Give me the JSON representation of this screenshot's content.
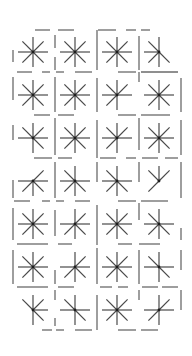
{
  "diagram": {
    "type": "star-grid-puzzle",
    "rows": 7,
    "cols": 4,
    "origin": {
      "x": 33,
      "y": 52
    },
    "spacing": {
      "x": 42,
      "y": 43
    },
    "spoke_length": 15,
    "colors": {
      "spoke": "#4a4a4a",
      "hub": "#1e1e1e",
      "wall": "#6a6a6a",
      "background": "#ffffff"
    },
    "cells": [
      [
        [
          "N",
          "NE",
          "E",
          "SE",
          "S",
          "SW",
          "W",
          "NW"
        ],
        [
          "N",
          "NE",
          "E",
          "SE",
          "S",
          "SW",
          "W",
          "NW"
        ],
        [
          "N",
          "NE",
          "E",
          "SE",
          "S",
          "SW",
          "W",
          "NW"
        ],
        [
          "N",
          "NW",
          "W",
          "SW",
          "S",
          "SE"
        ]
      ],
      [
        [
          "N",
          "NE",
          "E",
          "SE",
          "S",
          "SW",
          "W",
          "NW"
        ],
        [
          "N",
          "NE",
          "E",
          "SE",
          "S",
          "SW",
          "W",
          "NW"
        ],
        [
          "N",
          "NE",
          "E",
          "S",
          "SW",
          "W",
          "NW"
        ],
        [
          "N",
          "NE",
          "E",
          "SE",
          "S",
          "SW",
          "W",
          "NW"
        ]
      ],
      [
        [
          "N",
          "NE",
          "E",
          "SE",
          "S",
          "W",
          "NW"
        ],
        [
          "N",
          "NE",
          "E",
          "SE",
          "S",
          "SW",
          "W",
          "NW"
        ],
        [
          "N",
          "NE",
          "E",
          "S",
          "SW",
          "W",
          "NW"
        ],
        [
          "N",
          "NE",
          "E",
          "SE",
          "S",
          "SW",
          "W",
          "NW"
        ]
      ],
      [
        [
          "NE",
          "E",
          "SE",
          "S",
          "SW",
          "W"
        ],
        [
          "N",
          "NW",
          "W",
          "E",
          "SE",
          "S",
          "SW"
        ],
        [
          "N",
          "NW",
          "W",
          "E",
          "SE",
          "S",
          "SW"
        ],
        [
          "N",
          "NE",
          "NW",
          "SW"
        ]
      ],
      [
        [
          "N",
          "NE",
          "E",
          "SE",
          "S",
          "SW",
          "W",
          "NW"
        ],
        [
          "N",
          "NE",
          "E",
          "SE",
          "S",
          "SW",
          "W"
        ],
        [
          "N",
          "NE",
          "E",
          "SE",
          "S",
          "SW",
          "W",
          "NW"
        ],
        [
          "N",
          "NW",
          "W",
          "SE",
          "S",
          "SW",
          "E"
        ]
      ],
      [
        [
          "N",
          "NE",
          "E",
          "SE",
          "S",
          "SW",
          "W",
          "NW"
        ],
        [
          "N",
          "NE",
          "E",
          "SE",
          "S",
          "SW",
          "W"
        ],
        [
          "N",
          "NE",
          "E",
          "SE",
          "S",
          "SW",
          "W",
          "NW"
        ],
        [
          "N",
          "NW",
          "W",
          "E",
          "SE",
          "S"
        ]
      ],
      [
        [
          "NW",
          "N",
          "NE",
          "E",
          "SE",
          "S"
        ],
        [
          "NW",
          "N",
          "E",
          "SE",
          "S",
          "W"
        ],
        [
          "N",
          "NE",
          "E",
          "SE",
          "S",
          "SW",
          "W",
          "NW"
        ],
        [
          "N",
          "NE",
          "E",
          "W",
          "S",
          "SW"
        ]
      ]
    ],
    "walls": [
      [
        35,
        30,
        50,
        30
      ],
      [
        58,
        30,
        74,
        30
      ],
      [
        98,
        30,
        116,
        30
      ],
      [
        126,
        30,
        136,
        30
      ],
      [
        141,
        30,
        150,
        30
      ],
      [
        13,
        50,
        13,
        62
      ],
      [
        55,
        35,
        55,
        48
      ],
      [
        55,
        57,
        55,
        70
      ],
      [
        97,
        30,
        97,
        70
      ],
      [
        139,
        36,
        139,
        70
      ],
      [
        17,
        72,
        32,
        72
      ],
      [
        42,
        72,
        50,
        72
      ],
      [
        56,
        72,
        64,
        72
      ],
      [
        75,
        72,
        92,
        72
      ],
      [
        118,
        72,
        136,
        72
      ],
      [
        141,
        72,
        178,
        72
      ],
      [
        13,
        77,
        13,
        100
      ],
      [
        55,
        77,
        55,
        112
      ],
      [
        97,
        78,
        97,
        112
      ],
      [
        139,
        72,
        139,
        82
      ],
      [
        181,
        78,
        181,
        112
      ],
      [
        34,
        115,
        50,
        115
      ],
      [
        58,
        115,
        74,
        115
      ],
      [
        118,
        115,
        136,
        115
      ],
      [
        141,
        115,
        170,
        115
      ],
      [
        13,
        125,
        13,
        140
      ],
      [
        55,
        118,
        55,
        155
      ],
      [
        97,
        120,
        97,
        158
      ],
      [
        139,
        118,
        139,
        150
      ],
      [
        181,
        120,
        181,
        155
      ],
      [
        34,
        158,
        52,
        158
      ],
      [
        58,
        158,
        72,
        158
      ],
      [
        100,
        158,
        116,
        158
      ],
      [
        126,
        158,
        136,
        158
      ],
      [
        142,
        158,
        158,
        158
      ],
      [
        165,
        158,
        178,
        158
      ],
      [
        13,
        180,
        13,
        198
      ],
      [
        55,
        162,
        55,
        198
      ],
      [
        97,
        162,
        97,
        182
      ],
      [
        139,
        162,
        139,
        182
      ],
      [
        181,
        162,
        181,
        198
      ],
      [
        14,
        201,
        30,
        201
      ],
      [
        42,
        201,
        50,
        201
      ],
      [
        56,
        201,
        64,
        201
      ],
      [
        75,
        201,
        90,
        201
      ],
      [
        118,
        201,
        136,
        201
      ],
      [
        141,
        201,
        168,
        201
      ],
      [
        13,
        208,
        13,
        240
      ],
      [
        55,
        210,
        55,
        236
      ],
      [
        97,
        205,
        97,
        245
      ],
      [
        139,
        203,
        139,
        220
      ],
      [
        181,
        228,
        181,
        240
      ],
      [
        17,
        244,
        48,
        244
      ],
      [
        58,
        244,
        72,
        244
      ],
      [
        118,
        244,
        132,
        244
      ],
      [
        139,
        244,
        160,
        244
      ],
      [
        13,
        250,
        13,
        284
      ],
      [
        55,
        270,
        55,
        284
      ],
      [
        97,
        248,
        97,
        284
      ],
      [
        139,
        250,
        139,
        284
      ],
      [
        181,
        250,
        181,
        270
      ],
      [
        17,
        287,
        48,
        287
      ],
      [
        58,
        287,
        74,
        287
      ],
      [
        100,
        287,
        112,
        287
      ],
      [
        118,
        287,
        128,
        287
      ],
      [
        142,
        287,
        158,
        287
      ],
      [
        162,
        287,
        178,
        287
      ],
      [
        55,
        290,
        55,
        300
      ],
      [
        55,
        318,
        55,
        326
      ],
      [
        97,
        295,
        97,
        330
      ],
      [
        139,
        290,
        139,
        300
      ],
      [
        181,
        290,
        181,
        310
      ],
      [
        42,
        330,
        52,
        330
      ],
      [
        56,
        330,
        64,
        330
      ],
      [
        75,
        330,
        92,
        330
      ],
      [
        118,
        330,
        136,
        330
      ],
      [
        141,
        330,
        158,
        330
      ]
    ]
  }
}
